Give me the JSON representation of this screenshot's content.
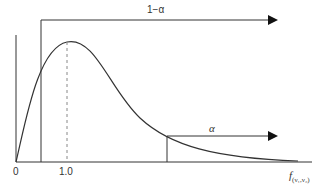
{
  "diagram": {
    "type": "F-distribution density with critical region",
    "labels": {
      "upper_region": "1−α",
      "tail_region": "α",
      "origin": "0",
      "mode_tick": "1.0",
      "x_axis_var": "f",
      "x_axis_sub": "(ν₁,ν₂)"
    },
    "colors": {
      "line": "#333333",
      "dashed": "#888888",
      "background": "#ffffff"
    }
  }
}
